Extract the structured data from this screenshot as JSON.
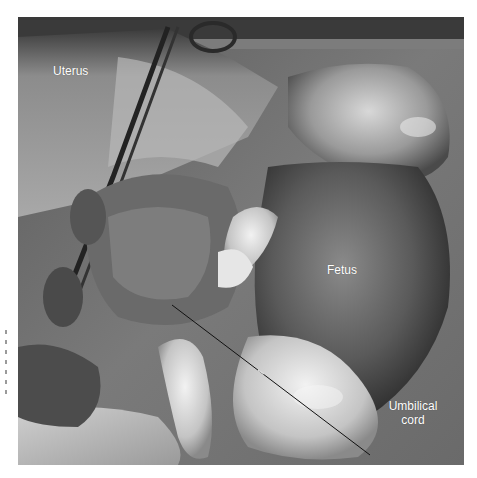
{
  "figure": {
    "labels": {
      "uterus": "Uterus",
      "fetus": "Fetus",
      "umbilical_line1": "Umbilical",
      "umbilical_line2": "cord"
    },
    "leader_line": {
      "from": [
        172,
        305
      ],
      "to": [
        370,
        455
      ],
      "color": "#111111"
    },
    "colors": {
      "background": "#ffffff",
      "label_text": "#ffffff"
    }
  }
}
